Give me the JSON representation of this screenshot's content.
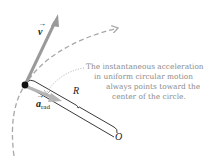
{
  "figure": {
    "labels": {
      "velocity": "v",
      "acceleration_main": "a",
      "acceleration_sub": "rad",
      "radius": "R",
      "center": "O"
    },
    "caption_lines": [
      "The instantaneous acceleration",
      "in uniform circular motion",
      "always points toward the",
      "center of the circle."
    ],
    "colors": {
      "arrow_gray": "#9a9a9a",
      "dashed_path": "#a8a8a8",
      "text_gray": "#8a8a8a",
      "bracket": "#222222",
      "particle": "#111111"
    }
  }
}
